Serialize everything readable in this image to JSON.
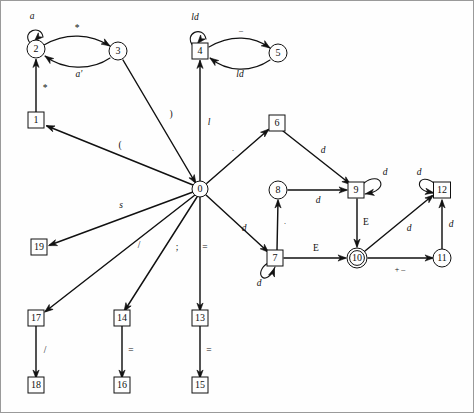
{
  "diagram": {
    "type": "finite-state-transition-diagram",
    "title": "",
    "background_color": "#fefefe",
    "stroke_color": "#111111",
    "nodes": [
      {
        "id": "0",
        "label": "0",
        "shape": "circle",
        "x": 199,
        "y": 188,
        "r": 8
      },
      {
        "id": "1",
        "label": "1",
        "shape": "box",
        "x": 35,
        "y": 119,
        "w": 16,
        "h": 16
      },
      {
        "id": "2",
        "label": "2",
        "shape": "circle",
        "x": 35,
        "y": 48,
        "r": 9
      },
      {
        "id": "3",
        "label": "3",
        "shape": "circle",
        "x": 117,
        "y": 50,
        "r": 9
      },
      {
        "id": "4",
        "label": "4",
        "shape": "box",
        "x": 199,
        "y": 50,
        "w": 16,
        "h": 16
      },
      {
        "id": "5",
        "label": "5",
        "shape": "circle",
        "x": 277,
        "y": 52,
        "r": 9
      },
      {
        "id": "6",
        "label": "6",
        "shape": "box",
        "x": 276,
        "y": 122,
        "w": 16,
        "h": 16
      },
      {
        "id": "7",
        "label": "7",
        "shape": "box",
        "x": 274,
        "y": 257,
        "w": 16,
        "h": 16
      },
      {
        "id": "8",
        "label": "8",
        "shape": "circle",
        "x": 277,
        "y": 189,
        "r": 9
      },
      {
        "id": "9",
        "label": "9",
        "shape": "box",
        "x": 355,
        "y": 189,
        "w": 16,
        "h": 16
      },
      {
        "id": "10",
        "label": "10",
        "shape": "double-circle",
        "x": 356,
        "y": 257,
        "r": 10
      },
      {
        "id": "11",
        "label": "11",
        "shape": "circle",
        "x": 441,
        "y": 257,
        "r": 9
      },
      {
        "id": "12",
        "label": "12",
        "shape": "box",
        "x": 441,
        "y": 189,
        "w": 17,
        "h": 16
      },
      {
        "id": "13",
        "label": "13",
        "shape": "box",
        "x": 199,
        "y": 317,
        "w": 16,
        "h": 16
      },
      {
        "id": "14",
        "label": "14",
        "shape": "box",
        "x": 121,
        "y": 317,
        "w": 16,
        "h": 16
      },
      {
        "id": "15",
        "label": "15",
        "shape": "box",
        "x": 199,
        "y": 384,
        "w": 16,
        "h": 16
      },
      {
        "id": "16",
        "label": "16",
        "shape": "box",
        "x": 121,
        "y": 384,
        "w": 16,
        "h": 16
      },
      {
        "id": "17",
        "label": "17",
        "shape": "box",
        "x": 35,
        "y": 317,
        "w": 16,
        "h": 16
      },
      {
        "id": "18",
        "label": "18",
        "shape": "box",
        "x": 35,
        "y": 384,
        "w": 16,
        "h": 16
      },
      {
        "id": "19",
        "label": "19",
        "shape": "box",
        "x": 38,
        "y": 246,
        "w": 16,
        "h": 16
      }
    ],
    "edges": [
      {
        "id": "e-2-2",
        "from": "2",
        "to": "2",
        "label": "a",
        "style": "italic",
        "kind": "self-loop",
        "path": "M 29 42 C 20 30, 40 23, 42 36",
        "arrow": [
          33.5,
          40.0,
          135
        ],
        "label_x": 31,
        "label_y": 16
      },
      {
        "id": "e-2-3",
        "from": "2",
        "to": "3",
        "label": "*",
        "style": "upright",
        "kind": "curve",
        "path": "M 43 44 C 65 31, 90 33, 109 45",
        "arrow": [
          109.0,
          45.0,
          32
        ],
        "label_x": 76,
        "label_y": 28
      },
      {
        "id": "e-3-2",
        "from": "3",
        "to": "2",
        "label": "a'",
        "style": "italic",
        "kind": "curve",
        "path": "M 109 57 C 90 70, 62 69, 44 55",
        "arrow": [
          44.0,
          55.0,
          216
        ],
        "label_x": 78,
        "label_y": 74
      },
      {
        "id": "e-1-2",
        "from": "1",
        "to": "2",
        "label": "*",
        "style": "upright",
        "kind": "line",
        "path": "M 35 111 L 35 59",
        "arrow": [
          35.0,
          58.0,
          270
        ],
        "label_x": 44,
        "label_y": 88
      },
      {
        "id": "e-0-1",
        "from": "0",
        "to": "1",
        "label": "(",
        "style": "upright",
        "kind": "line",
        "path": "M 192 184 L 46 125",
        "arrow": [
          45.0,
          124.6,
          202
        ],
        "label_x": 119,
        "label_y": 145
      },
      {
        "id": "e-0-3",
        "from": "0",
        "to": "3",
        "label": ")",
        "style": "upright",
        "kind": "line",
        "path": "M 122 59 L 194 181",
        "arrow": [
          195.0,
          182.5,
          59
        ],
        "label_x": 170,
        "label_y": 114
      },
      {
        "id": "e-4-4",
        "from": "4",
        "to": "4",
        "label": "ld",
        "style": "italic",
        "kind": "self-loop",
        "path": "M 192 45 C 182 32, 202 24, 205 38",
        "arrow": [
          196.5,
          42.5,
          130
        ],
        "label_x": 194,
        "label_y": 17
      },
      {
        "id": "e-4-5",
        "from": "4",
        "to": "5",
        "label": "–",
        "style": "upright",
        "kind": "curve",
        "path": "M 208 46 C 230 33, 253 35, 269 47",
        "arrow": [
          269.0,
          47.0,
          34
        ],
        "label_x": 240,
        "label_y": 30
      },
      {
        "id": "e-5-4",
        "from": "5",
        "to": "4",
        "label": "ld",
        "style": "italic",
        "kind": "curve",
        "path": "M 269 59 C 250 72, 226 71, 209 57",
        "arrow": [
          209.0,
          57.0,
          216
        ],
        "label_x": 239,
        "label_y": 74
      },
      {
        "id": "e-0-4",
        "from": "0",
        "to": "4",
        "label": "l",
        "style": "italic",
        "kind": "line",
        "path": "M 199 180 L 199 60",
        "arrow": [
          199.0,
          59.0,
          270
        ],
        "label_x": 208,
        "label_y": 122
      },
      {
        "id": "e-0-6",
        "from": "0",
        "to": "6",
        "label": ".",
        "style": "upright",
        "kind": "line",
        "path": "M 205 183 L 267 129",
        "arrow": [
          268.0,
          128.0,
          319
        ],
        "label_x": 232,
        "label_y": 148
      },
      {
        "id": "e-6-9",
        "from": "6",
        "to": "9",
        "label": "d",
        "style": "italic",
        "kind": "line",
        "path": "M 282 130 L 348 182",
        "arrow": [
          349.5,
          183.5,
          38
        ],
        "label_x": 322,
        "label_y": 150
      },
      {
        "id": "e-9-9",
        "from": "9",
        "to": "9",
        "label": "d",
        "style": "italic",
        "kind": "self-loop",
        "path": "M 363 182 C 380 169, 390 190, 364 193",
        "arrow": [
          364.5,
          192.8,
          170
        ],
        "label_x": 384,
        "label_y": 172
      },
      {
        "id": "e-8-9",
        "from": "8",
        "to": "9",
        "label": "d",
        "style": "italic",
        "kind": "line",
        "path": "M 287 189 L 345 189",
        "arrow": [
          346.5,
          189.0,
          0
        ],
        "label_x": 317,
        "label_y": 200
      },
      {
        "id": "e-7-8",
        "from": "7",
        "to": "8",
        "label": ".",
        "style": "upright",
        "kind": "line",
        "path": "M 276 249 L 277 200",
        "arrow": [
          277.0,
          198.5,
          270
        ],
        "label_x": 284,
        "label_y": 221
      },
      {
        "id": "e-0-7",
        "from": "0",
        "to": "7",
        "label": "d",
        "style": "italic",
        "kind": "line",
        "path": "M 205 194 L 266 250",
        "arrow": [
          267.5,
          251.3,
          43
        ],
        "label_x": 243,
        "label_y": 228
      },
      {
        "id": "e-7-7",
        "from": "7",
        "to": "7",
        "label": "d",
        "style": "italic",
        "kind": "self-loop",
        "path": "M 267 262 C 251 272, 265 288, 274 266",
        "arrow": [
          273.5,
          267.0,
          290
        ],
        "label_x": 258,
        "label_y": 283
      },
      {
        "id": "e-7-10",
        "from": "7",
        "to": "10",
        "label": "E",
        "style": "upright",
        "kind": "line",
        "path": "M 283 257 L 344 257",
        "arrow": [
          345.5,
          257.0,
          0
        ],
        "label_x": 315,
        "label_y": 248
      },
      {
        "id": "e-9-10",
        "from": "9",
        "to": "10",
        "label": "E",
        "style": "upright",
        "kind": "line",
        "path": "M 356 198 L 356 245",
        "arrow": [
          356.0,
          246.5,
          90
        ],
        "label_x": 365,
        "label_y": 222
      },
      {
        "id": "e-10-11",
        "from": "10",
        "to": "11",
        "label": "+ –",
        "style": "upright",
        "kind": "line",
        "path": "M 367 257 L 431 257",
        "arrow": [
          432.5,
          257.0,
          0
        ],
        "label_x": 399,
        "label_y": 269
      },
      {
        "id": "e-10-12",
        "from": "10",
        "to": "12",
        "label": "d",
        "style": "italic",
        "kind": "line",
        "path": "M 364 250 L 431 195",
        "arrow": [
          432.5,
          194.0,
          321
        ],
        "label_x": 408,
        "label_y": 228
      },
      {
        "id": "e-11-12",
        "from": "11",
        "to": "12",
        "label": "d",
        "style": "italic",
        "kind": "line",
        "path": "M 441 248 L 441 200",
        "arrow": [
          441.0,
          198.5,
          270
        ],
        "label_x": 450,
        "label_y": 224
      },
      {
        "id": "e-12-12",
        "from": "12",
        "to": "12",
        "label": "d",
        "style": "italic",
        "kind": "self-loop",
        "path": "M 433 182 C 418 170, 410 190, 432 192",
        "arrow": [
          432.8,
          191.8,
          10
        ],
        "label_x": 418,
        "label_y": 172
      },
      {
        "id": "e-0-19",
        "from": "0",
        "to": "19",
        "label": "s",
        "style": "italic",
        "kind": "line",
        "path": "M 192 191 L 49 244",
        "arrow": [
          47.5,
          244.6,
          160
        ],
        "label_x": 120,
        "label_y": 205
      },
      {
        "id": "e-0-17",
        "from": "0",
        "to": "17",
        "label": "",
        "style": "upright",
        "kind": "line",
        "path": "M 194 194 L 45 310",
        "arrow": [
          43.5,
          311.2,
          142
        ],
        "label_x": 0,
        "label_y": 0
      },
      {
        "id": "e-0-14",
        "from": "0",
        "to": "14",
        "label": "/",
        "style": "upright",
        "kind": "line",
        "path": "M 196 196 L 124 309",
        "arrow": [
          123.0,
          310.5,
          122
        ],
        "label_x": 138,
        "label_y": 245
      },
      {
        "id": "e-0-13",
        "from": "0",
        "to": "13",
        "label": ";",
        "style": "upright",
        "kind": "line",
        "path": "M 199 196 L 199 309",
        "arrow": [
          199.0,
          310.5,
          90
        ],
        "label_x": 176,
        "label_y": 247
      },
      {
        "id": "e-0-13b",
        "from": "0",
        "to": "13",
        "label": "=",
        "style": "upright",
        "kind": "none",
        "path": "",
        "arrow": null,
        "label_x": 204,
        "label_y": 247
      },
      {
        "id": "e-17-18",
        "from": "17",
        "to": "18",
        "label": "/",
        "style": "upright",
        "kind": "line",
        "path": "M 35 325 L 35 376",
        "arrow": [
          35.0,
          377.5,
          90
        ],
        "label_x": 44,
        "label_y": 350
      },
      {
        "id": "e-14-16",
        "from": "14",
        "to": "16",
        "label": "=",
        "style": "upright",
        "kind": "line",
        "path": "M 121 325 L 121 376",
        "arrow": [
          121.0,
          377.5,
          90
        ],
        "label_x": 130,
        "label_y": 350
      },
      {
        "id": "e-13-15",
        "from": "13",
        "to": "15",
        "label": "=",
        "style": "upright",
        "kind": "line",
        "path": "M 199 325 L 199 376",
        "arrow": [
          199.0,
          377.5,
          90
        ],
        "label_x": 208,
        "label_y": 350
      }
    ]
  }
}
